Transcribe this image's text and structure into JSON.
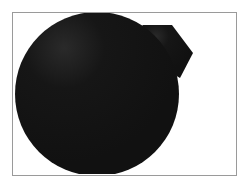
{
  "figure": {
    "frame": {
      "border_color": "#9a9a9a",
      "background": "#ffffff"
    },
    "shape": {
      "type": "circle-with-tab",
      "fill": "#141414",
      "highlight": "#2a2a2a",
      "circle": {
        "cx": 97,
        "cy": 94,
        "r": 82
      },
      "tab_points": "140,28 143,25 172,25 193,53 180,78 150,60"
    }
  }
}
